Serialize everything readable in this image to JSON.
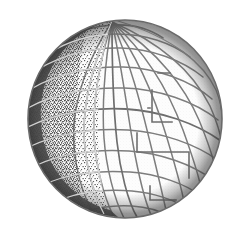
{
  "figure": {
    "kind": "line-art-illustration",
    "title": "Wireframe globe with graticule",
    "background_color": "#ffffff",
    "canvas": {
      "width": 243,
      "height": 232
    }
  },
  "globe": {
    "center_x": 125,
    "center_y": 119,
    "radius_x": 97,
    "radius_y": 99,
    "bounds": {
      "left": 28,
      "top": 20,
      "right": 222,
      "bottom": 218
    },
    "outline_color": "#6a6a6a",
    "grid_color": "#7d7d7d",
    "grid_color_light": "#9a9a9a",
    "fill_color": "#fdfdfd",
    "shadow_limb_color": "#4a4a4a",
    "stipple_color": "#555555",
    "pole_tilt_degrees": -16,
    "pole_top": {
      "x": 112,
      "y": 22
    },
    "pole_bottom": {
      "x": 140,
      "y": 216
    },
    "meridian_count": 12,
    "parallel_count": 9,
    "terminator_angle_degrees": 200
  },
  "parallels": {
    "label": "latitude-lines",
    "latitudes_degrees": [
      75,
      60,
      45,
      30,
      15,
      0,
      -15,
      -30,
      -45,
      -60,
      -75
    ]
  },
  "meridians": {
    "label": "longitude-lines",
    "longitudes_degrees": [
      0,
      15,
      30,
      45,
      60,
      75,
      90,
      105,
      120,
      135,
      150,
      165,
      180,
      195,
      210,
      225,
      240,
      255,
      270,
      285,
      300,
      315,
      330,
      345
    ]
  },
  "shading": {
    "limb_band_label": "dark-shaded-limb",
    "limb_band_side": "left",
    "limb_band_width_px": 14,
    "stipple_region_label": "stippled-landmass-texture",
    "stipple_region_side": "left-hemisphere",
    "stipple_density": 0.34
  },
  "artifacts": {
    "offset_segments_label": "grid-offset-step-artifacts",
    "count": 4,
    "note": "stepped rectangular breaks in the right-hemisphere graticule"
  }
}
